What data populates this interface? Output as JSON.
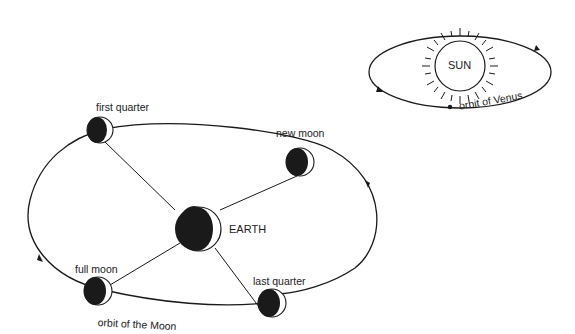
{
  "diagram": {
    "sun_system": {
      "sun_label": "SUN",
      "orbit_label": "orbit of Venus"
    },
    "earth_system": {
      "earth_label": "EARTH",
      "orbit_label": "orbit of the Moon",
      "phases": [
        {
          "label": "first quarter"
        },
        {
          "label": "new moon"
        },
        {
          "label": "full moon"
        },
        {
          "label": "last quarter"
        }
      ]
    },
    "colors": {
      "ink": "#1a1a1a",
      "background": "#ffffff"
    }
  }
}
